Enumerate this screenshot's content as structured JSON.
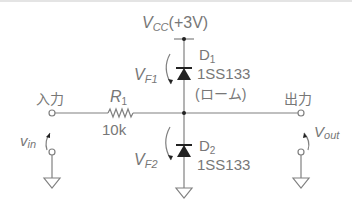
{
  "diagram": {
    "supply": {
      "symbol": "V",
      "sub": "CC",
      "value": "(+3V)"
    },
    "input_label": "入力",
    "output_label": "出力",
    "resistor": {
      "name": "R",
      "sub": "1",
      "value": "10k"
    },
    "d1": {
      "name": "D",
      "sub": "1",
      "part": "1SS133",
      "maker": "(ローム)"
    },
    "d2": {
      "name": "D",
      "sub": "2",
      "part": "1SS133"
    },
    "vf1": {
      "symbol": "V",
      "sub": "F1"
    },
    "vf2": {
      "symbol": "V",
      "sub": "F2"
    },
    "vin": {
      "symbol": "v",
      "sub": "in"
    },
    "vout": {
      "symbol": "V",
      "sub": "out"
    },
    "colors": {
      "line": "#808080",
      "text": "#777777",
      "fill": "#222222"
    }
  }
}
